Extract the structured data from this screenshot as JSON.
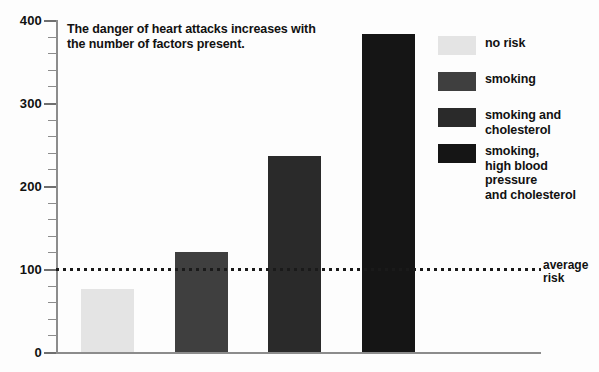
{
  "chart_data": {
    "type": "bar",
    "title": "The danger of heart attacks increases with the number of factors present.",
    "xlabel": "",
    "ylabel": "",
    "ylim": [
      0,
      400
    ],
    "grid": false,
    "legend_position": "right",
    "categories": [
      "no risk",
      "smoking",
      "smoking and cholesterol",
      "smoking, high blood pressure and cholesterol"
    ],
    "values": [
      76,
      120,
      236,
      383
    ],
    "bar_colors": [
      "#e4e4e4",
      "#3f3f3f",
      "#2a2a2a",
      "#151515"
    ],
    "y_ticks_major": [
      0,
      100,
      200,
      300,
      400
    ],
    "y_tick_labels": [
      "0",
      "100",
      "200",
      "300",
      "400"
    ],
    "y_ticks_minor": [
      20,
      40,
      60,
      80,
      120,
      140,
      160,
      180,
      220,
      240,
      260,
      280,
      320,
      340,
      360,
      380
    ],
    "annotations": [
      {
        "name": "average-risk",
        "value": 100,
        "label": "average\nrisk",
        "style": "dotted-horizontal-line"
      }
    ]
  },
  "legend": {
    "items": [
      {
        "label": "no risk",
        "color": "#e4e4e4"
      },
      {
        "label": "smoking",
        "color": "#3f3f3f"
      },
      {
        "label": "smoking and\ncholesterol",
        "color": "#2a2a2a"
      },
      {
        "label": "smoking,\nhigh blood pressure\nand cholesterol",
        "color": "#151515"
      }
    ]
  },
  "axis": {
    "y_labels": [
      "400",
      "300",
      "200",
      "100",
      "0"
    ]
  }
}
